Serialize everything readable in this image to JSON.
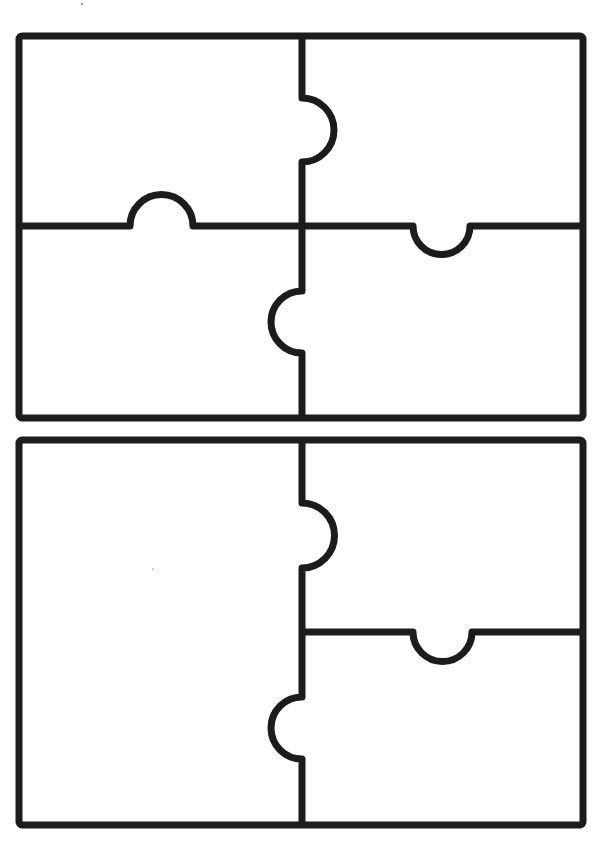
{
  "page": {
    "width": 610,
    "height": 856,
    "background": "#ffffff",
    "stroke_color": "#1c1c1c",
    "stroke_width": 7
  },
  "puzzles": [
    {
      "name": "puzzle-top-four-piece",
      "pieces": 4,
      "frame": {
        "x": 19,
        "y": 36,
        "width": 564,
        "height": 382,
        "radius": 3
      },
      "cuts": [
        {
          "name": "cut-top-vertical-upper",
          "orientation": "vertical",
          "path": "M302 36 L302 98 A32 32 0 0 1 302 162 L302 226"
        },
        {
          "name": "cut-top-vertical-lower",
          "orientation": "vertical",
          "path": "M302 226 L302 291 A31 31 0 0 0 302 353 L302 418"
        },
        {
          "name": "cut-top-horizontal-left",
          "orientation": "horizontal",
          "path": "M19 226 L130 226 A31.5 31.5 0 0 1 193 226 L302 226"
        },
        {
          "name": "cut-top-horizontal-right",
          "orientation": "horizontal",
          "path": "M302 226 L413 226 A28.5 28.5 0 0 0 470 226 L583 226"
        }
      ]
    },
    {
      "name": "puzzle-bottom-three-piece",
      "pieces": 3,
      "frame": {
        "x": 19,
        "y": 440,
        "width": 564,
        "height": 385,
        "radius": 3
      },
      "cuts": [
        {
          "name": "cut-bottom-vertical",
          "orientation": "vertical",
          "path": "M302 440 L302 503 A32.5 32.5 0 0 1 302 568 L302 697 A31 31 0 0 0 302 759 L302 825"
        },
        {
          "name": "cut-bottom-horizontal-right",
          "orientation": "horizontal",
          "path": "M302 632 L413 632 A29.5 29.5 0 0 0 472 632 L583 632"
        }
      ]
    }
  ],
  "marks": [
    {
      "name": "stray-mark-top",
      "x": 82,
      "y": 4,
      "r": 1
    },
    {
      "name": "stray-mark-bottom-left",
      "x": 153,
      "y": 569,
      "r": 0.8
    }
  ]
}
